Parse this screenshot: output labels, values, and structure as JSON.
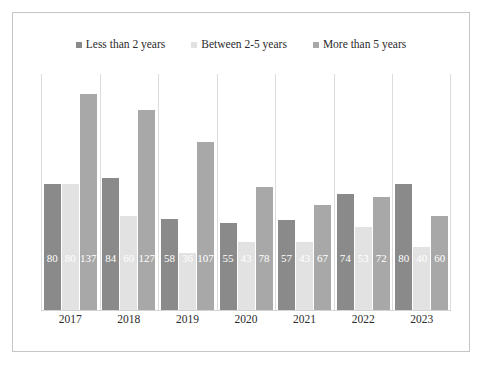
{
  "top_fragment": "",
  "chart_data": {
    "type": "bar",
    "title": "",
    "subtitle": "",
    "xlabel": "",
    "ylabel": "",
    "grid": false,
    "legend_position": "top-center",
    "ylim": [
      0,
      150
    ],
    "categories": [
      "2017",
      "2018",
      "2019",
      "2020",
      "2021",
      "2022",
      "2023"
    ],
    "series": [
      {
        "name": "Less than 2 years",
        "color": "#8a8a8a",
        "values": [
          80,
          84,
          58,
          55,
          57,
          74,
          80
        ]
      },
      {
        "name": "Between 2-5 years",
        "color": "#e2e2e2",
        "values": [
          80,
          60,
          36,
          43,
          43,
          53,
          40
        ]
      },
      {
        "name": "More than 5 years",
        "color": "#a8a8a8",
        "values": [
          137,
          127,
          107,
          78,
          67,
          72,
          60
        ]
      }
    ]
  }
}
